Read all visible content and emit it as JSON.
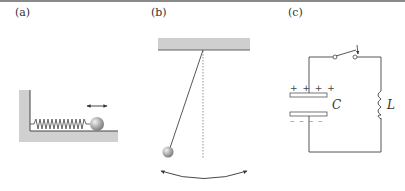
{
  "panels": [
    {
      "id": "a",
      "label": "(a)",
      "description": "Mass on a spring against a wall"
    },
    {
      "id": "b",
      "label": "(b)",
      "description": "Simple pendulum"
    },
    {
      "id": "c",
      "label": "(c)",
      "description": "LC circuit with switch"
    }
  ],
  "circuit": {
    "capacitor_label": "C",
    "inductor_label": "L",
    "plus_signs": "+ + + +",
    "minus_signs": "– – – –"
  },
  "colors": {
    "wall": "#cfcfcf",
    "line": "#444444",
    "topline": "#8a8a8a"
  }
}
